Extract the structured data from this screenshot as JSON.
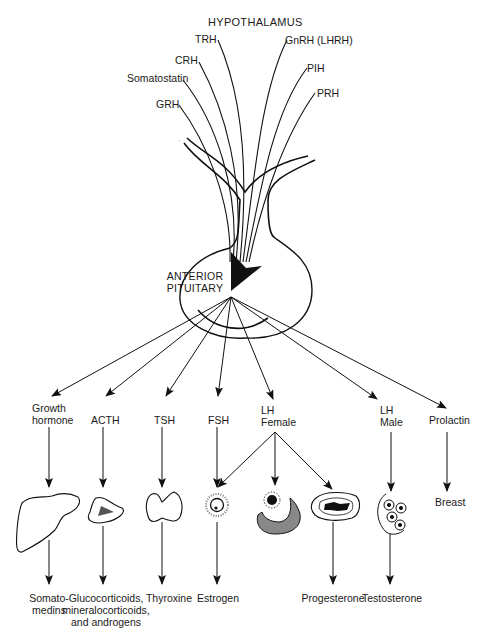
{
  "hypothalamus": {
    "title": "HYPOTHALAMUS",
    "releasing_hormones": [
      "TRH",
      "GnRH (LHRH)",
      "CRH",
      "PIH",
      "Somatostatin",
      "PRH",
      "GRH"
    ]
  },
  "pituitary": {
    "line1": "ANTERIOR",
    "line2": "PITUITARY"
  },
  "pituitary_hormones": [
    {
      "line1": "Growth",
      "line2": "hormone"
    },
    {
      "line1": "ACTH",
      "line2": ""
    },
    {
      "line1": "TSH",
      "line2": ""
    },
    {
      "line1": "FSH",
      "line2": ""
    },
    {
      "line1": "LH",
      "line2": "Female"
    },
    {
      "line1": "LH",
      "line2": "Male"
    },
    {
      "line1": "Prolactin",
      "line2": ""
    }
  ],
  "target_organs": [
    {
      "icon": "liver-icon"
    },
    {
      "icon": "adrenal-gland-icon"
    },
    {
      "icon": "thyroid-gland-icon"
    },
    {
      "icon": "ovarian-follicle-icon"
    },
    {
      "icon": "ovulated-follicle-icon"
    },
    {
      "icon": "corpus-luteum-icon"
    },
    {
      "icon": "testis-cells-icon"
    },
    {
      "label": "Breast"
    }
  ],
  "end_products": [
    {
      "line1": "Somato-",
      "line2": "medins",
      "line3": ""
    },
    {
      "line1": "Glucocorticoids,",
      "line2": "mineralocorticoids,",
      "line3": "and androgens"
    },
    {
      "line1": "Thyroxine",
      "line2": "",
      "line3": ""
    },
    {
      "line1": "Estrogen",
      "line2": "",
      "line3": ""
    },
    {
      "line1": "Progesterone",
      "line2": "",
      "line3": ""
    },
    {
      "line1": "Testosterone",
      "line2": "",
      "line3": ""
    }
  ]
}
